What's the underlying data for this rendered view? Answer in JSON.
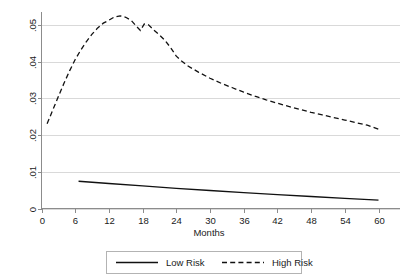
{
  "chart_data": {
    "type": "line",
    "title": "",
    "subtitle": "",
    "xlabel": "Months",
    "ylabel": "",
    "xlim": [
      0,
      60
    ],
    "ylim": [
      0,
      0.055
    ],
    "grid": "horizontal",
    "legend_position": "bottom-center",
    "xticks": [
      "0",
      "6",
      "12",
      "18",
      "24",
      "30",
      "36",
      "42",
      "48",
      "54",
      "60"
    ],
    "xtick_values": [
      0,
      6,
      12,
      18,
      24,
      30,
      36,
      42,
      48,
      54,
      60
    ],
    "yticks": [
      "0",
      ".01",
      ".02",
      ".03",
      ".04",
      ".05"
    ],
    "ytick_values": [
      0,
      0.01,
      0.02,
      0.03,
      0.04,
      0.05
    ],
    "series": [
      {
        "name": "Low Risk",
        "style": "solid",
        "color": "#111111",
        "x": [
          6.6,
          12,
          18,
          24,
          30,
          36,
          42,
          48,
          54,
          60
        ],
        "values": [
          0.00742,
          0.00681,
          0.00615,
          0.00551,
          0.00491,
          0.00434,
          0.00379,
          0.00327,
          0.00276,
          0.00229
        ]
      },
      {
        "name": "High Risk",
        "style": "dashed",
        "color": "#111111",
        "x": [
          1,
          2,
          3,
          4,
          5,
          6,
          7,
          8,
          9,
          10,
          11,
          12,
          13,
          14,
          15,
          16,
          17,
          17.6,
          18.3,
          19,
          20,
          21,
          22,
          23,
          24,
          25,
          26,
          28,
          30,
          32,
          34,
          36,
          38,
          40,
          42,
          44,
          46,
          48,
          50,
          52,
          54,
          56,
          58,
          60
        ],
        "values": [
          0.0231,
          0.0268,
          0.0305,
          0.0341,
          0.0375,
          0.0406,
          0.0432,
          0.0455,
          0.0475,
          0.0492,
          0.0505,
          0.0513,
          0.0522,
          0.0525,
          0.0521,
          0.0512,
          0.0495,
          0.0485,
          0.0503,
          0.0501,
          0.0486,
          0.0473,
          0.0458,
          0.0438,
          0.0415,
          0.0401,
          0.0389,
          0.0371,
          0.0355,
          0.0341,
          0.0329,
          0.0317,
          0.0306,
          0.0296,
          0.0287,
          0.0278,
          0.027,
          0.0262,
          0.0255,
          0.0248,
          0.0241,
          0.0234,
          0.0227,
          0.0216
        ]
      }
    ],
    "legend_entries": [
      {
        "label": "Low Risk",
        "style": "solid"
      },
      {
        "label": "High Risk",
        "style": "dashed"
      }
    ]
  }
}
